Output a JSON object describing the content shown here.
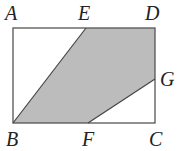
{
  "diagram": {
    "type": "geometry-rectangle-shaded-region",
    "colors": {
      "background": "#ffffff",
      "stroke": "#555555",
      "shade": "#bcbcbc",
      "label": "#222222"
    },
    "points": {
      "A": {
        "label": "A",
        "x": 13,
        "y": 28
      },
      "B": {
        "label": "B",
        "x": 13,
        "y": 123
      },
      "C": {
        "label": "C",
        "x": 155,
        "y": 123
      },
      "D": {
        "label": "D",
        "x": 155,
        "y": 28
      },
      "E": {
        "label": "E",
        "x": 86,
        "y": 28
      },
      "F": {
        "label": "F",
        "x": 88,
        "y": 123
      },
      "G": {
        "label": "G",
        "x": 155,
        "y": 79
      }
    },
    "rectangle": "ABCD",
    "shaded_polygon": [
      "B",
      "E",
      "D",
      "G",
      "F"
    ],
    "segments": [
      "AB",
      "BC",
      "CD",
      "DA",
      "BE",
      "FG"
    ]
  }
}
